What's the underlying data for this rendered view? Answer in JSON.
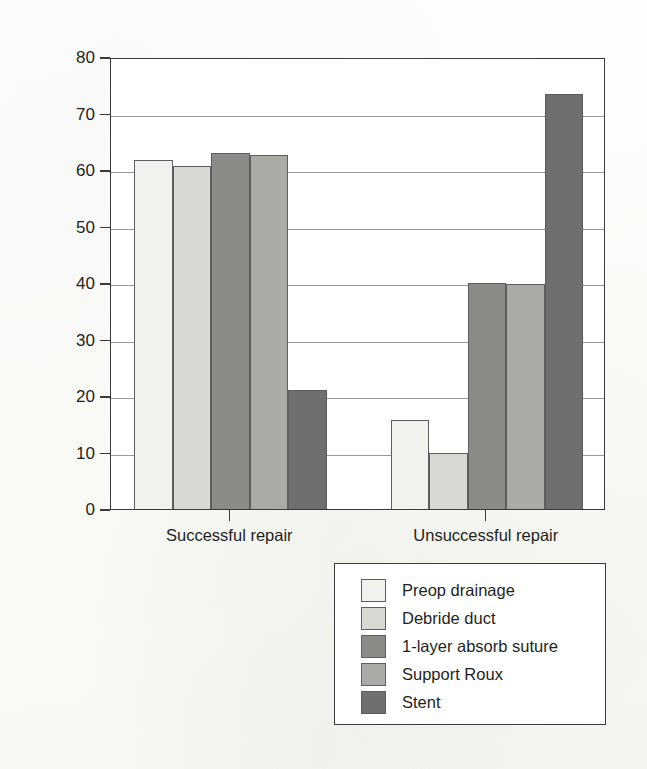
{
  "chart_data": {
    "type": "bar",
    "title": "",
    "subtitle": "",
    "xlabel": "",
    "ylabel": "Percent applying technique",
    "categories": [
      "Successful repair",
      "Unsuccessful repair"
    ],
    "ylim": [
      0,
      80
    ],
    "yticks": [
      0,
      10,
      20,
      30,
      40,
      50,
      60,
      70,
      80
    ],
    "ytick_labels": [
      "0",
      "10",
      "20",
      "30",
      "40",
      "50",
      "60",
      "70",
      "80"
    ],
    "grid": true,
    "grid_axis": "y",
    "legend_position": "below-right",
    "series": [
      {
        "name": "Preop drainage",
        "color": "#f1f1ed",
        "values": [
          61.8,
          15.8
        ]
      },
      {
        "name": "Debride duct",
        "color": "#d9d9d4",
        "values": [
          60.7,
          10.0
        ]
      },
      {
        "name": "1-layer absorb suture",
        "color": "#8a8a87",
        "values": [
          63.1,
          40.0
        ]
      },
      {
        "name": "Support Roux",
        "color": "#aaaaa6",
        "values": [
          62.6,
          39.8
        ]
      },
      {
        "name": "Stent",
        "color": "#6f6f6d",
        "values": [
          21.0,
          73.5
        ]
      }
    ]
  },
  "legend": {
    "items": [
      {
        "label": "Preop drainage"
      },
      {
        "label": "Debride duct"
      },
      {
        "label": "1-layer absorb suture"
      },
      {
        "label": "Support Roux"
      },
      {
        "label": "Stent"
      }
    ]
  },
  "axes": {
    "y_title": "Percent applying technique",
    "x_categories": [
      "Successful repair",
      "Unsuccessful repair"
    ]
  },
  "colors": {
    "frame": "#3a3a3a",
    "gridline": "#9a9a9a",
    "bar_outline": "#5e5e5e",
    "plot_background": "#ffffff",
    "page_background": "#fdfdfb"
  }
}
